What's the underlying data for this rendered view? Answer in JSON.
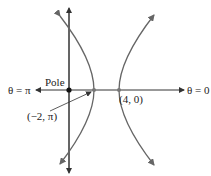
{
  "diagram": {
    "type": "polar-hyperbola",
    "labels": {
      "theta_pi": "θ = π",
      "theta_zero": "θ = 0",
      "pole": "Pole",
      "vertex_right": "(4, 0)",
      "vertex_left": "(−2, π)"
    },
    "colors": {
      "axis": "#333333",
      "curve": "#666666",
      "point": "#111111"
    }
  }
}
